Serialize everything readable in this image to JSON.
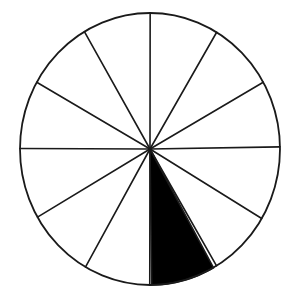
{
  "figure": {
    "name": "fraction-circle-twelfths",
    "title": "Circle divided into twelve equal sectors with one sector shaded",
    "background_color": "#ffffff",
    "ink_color": "#1a1a1a",
    "shaded_color": "#000000",
    "unshaded_color": "#ffffff"
  },
  "chart_data": {
    "type": "pie",
    "title": "",
    "subtitle": "",
    "xlabel": "",
    "ylabel": "",
    "grid": false,
    "legend_position": "none",
    "categories": [
      "slice-1",
      "slice-2",
      "slice-3",
      "slice-4",
      "slice-5",
      "slice-6",
      "slice-7",
      "slice-8",
      "slice-9",
      "slice-10",
      "slice-11",
      "slice-12"
    ],
    "values": [
      1,
      1,
      1,
      1,
      1,
      1,
      1,
      1,
      1,
      1,
      1,
      1
    ],
    "slice_angle_degrees": 30,
    "total_slices": 12,
    "shaded_slices": 1,
    "unshaded_slices": 11,
    "fraction_shaded": "1/12",
    "percent_shaded": 8.33,
    "series": [
      {
        "name": "sectors",
        "values": [
          1,
          1,
          1,
          1,
          1,
          1,
          1,
          1,
          1,
          1,
          1,
          1
        ],
        "colors": [
          "#ffffff",
          "#ffffff",
          "#ffffff",
          "#ffffff",
          "#ffffff",
          "#ffffff",
          "#ffffff",
          "#ffffff",
          "#000000",
          "#ffffff",
          "#ffffff",
          "#ffffff"
        ]
      }
    ],
    "annotations": []
  },
  "geometry": {
    "center_x": 150,
    "center_y": 149,
    "radius_x": 130,
    "radius_y": 136,
    "start_angle_degrees": 0,
    "shaded_sector_index": 8,
    "shaded_start_angle_degrees": 60,
    "shaded_end_angle_degrees": 90,
    "stroke_width": 1.6,
    "outline_stroke_width": 1.8
  }
}
